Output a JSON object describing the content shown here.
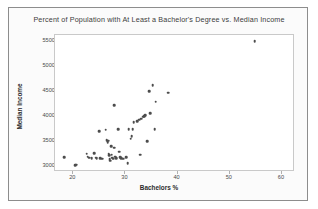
{
  "chart_data": {
    "type": "scatter",
    "title": "Percent of Population with At Least a Bachelor's Degree vs. Median Income",
    "xlabel": "Bachelors %",
    "ylabel": "Median Income",
    "xlim": [
      16.5,
      62.5
    ],
    "ylim": [
      28700,
      56300
    ],
    "xticks": [
      20,
      30,
      40,
      50,
      60
    ],
    "xtick_labels": [
      "20",
      "30",
      "40",
      "50",
      "60"
    ],
    "yticks": [
      30000,
      35000,
      40000,
      45000,
      50000,
      55000
    ],
    "ytick_labels": [
      "30000",
      "35000",
      "40000",
      "45000",
      "50000",
      "55000"
    ],
    "grid": false,
    "legend": false,
    "marker_color": "#4c4c4c",
    "points": [
      {
        "x": 18.3,
        "y": 31700
      },
      {
        "x": 20.4,
        "y": 30050
      },
      {
        "x": 20.6,
        "y": 30150
      },
      {
        "x": 22.6,
        "y": 32400
      },
      {
        "x": 22.8,
        "y": 31800
      },
      {
        "x": 23.0,
        "y": 31600
      },
      {
        "x": 23.5,
        "y": 31500
      },
      {
        "x": 24.0,
        "y": 32500
      },
      {
        "x": 24.3,
        "y": 31550
      },
      {
        "x": 24.5,
        "y": 31500
      },
      {
        "x": 25.0,
        "y": 36900
      },
      {
        "x": 25.2,
        "y": 31450
      },
      {
        "x": 25.6,
        "y": 31400
      },
      {
        "x": 26.2,
        "y": 37200
      },
      {
        "x": 26.4,
        "y": 35100
      },
      {
        "x": 26.6,
        "y": 34700
      },
      {
        "x": 26.7,
        "y": 35000
      },
      {
        "x": 26.8,
        "y": 32400
      },
      {
        "x": 26.9,
        "y": 32100
      },
      {
        "x": 27.0,
        "y": 31250
      },
      {
        "x": 27.1,
        "y": 30950
      },
      {
        "x": 27.3,
        "y": 33900
      },
      {
        "x": 27.4,
        "y": 32200
      },
      {
        "x": 27.5,
        "y": 31600
      },
      {
        "x": 27.6,
        "y": 31400
      },
      {
        "x": 27.8,
        "y": 42200
      },
      {
        "x": 27.9,
        "y": 33600
      },
      {
        "x": 28.0,
        "y": 31800
      },
      {
        "x": 28.2,
        "y": 31500
      },
      {
        "x": 28.6,
        "y": 37300
      },
      {
        "x": 28.8,
        "y": 32800
      },
      {
        "x": 29.0,
        "y": 31700
      },
      {
        "x": 29.2,
        "y": 31500
      },
      {
        "x": 29.6,
        "y": 31350
      },
      {
        "x": 30.2,
        "y": 31700
      },
      {
        "x": 30.4,
        "y": 30450
      },
      {
        "x": 30.6,
        "y": 37300
      },
      {
        "x": 31.0,
        "y": 35400
      },
      {
        "x": 31.2,
        "y": 35900
      },
      {
        "x": 31.4,
        "y": 37300
      },
      {
        "x": 31.6,
        "y": 38700
      },
      {
        "x": 32.2,
        "y": 38900
      },
      {
        "x": 32.6,
        "y": 39200
      },
      {
        "x": 32.8,
        "y": 32200
      },
      {
        "x": 33.0,
        "y": 39400
      },
      {
        "x": 33.4,
        "y": 39800
      },
      {
        "x": 33.6,
        "y": 40000
      },
      {
        "x": 33.8,
        "y": 40200
      },
      {
        "x": 34.2,
        "y": 34900
      },
      {
        "x": 34.6,
        "y": 45000
      },
      {
        "x": 34.8,
        "y": 40600
      },
      {
        "x": 35.2,
        "y": 46200
      },
      {
        "x": 35.6,
        "y": 37300
      },
      {
        "x": 35.8,
        "y": 42900
      },
      {
        "x": 38.2,
        "y": 44700
      },
      {
        "x": 54.8,
        "y": 55000
      }
    ]
  }
}
